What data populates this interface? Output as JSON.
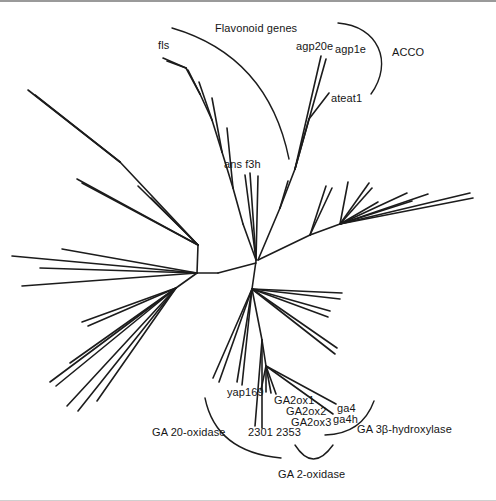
{
  "figure": {
    "width": 496,
    "height": 501,
    "background": "#ffffff",
    "branch_color": "#1c1c1c",
    "frame_top_color": "#9a9a9a",
    "frame_bottom_color": "#cfcfcf",
    "type": "unrooted-phylogenetic-tree"
  },
  "labels": [
    {
      "id": "flavonoid-genes",
      "text": "Flavonoid genes",
      "x": 215,
      "y": 20
    },
    {
      "id": "fls",
      "text": "fls",
      "x": 158,
      "y": 37
    },
    {
      "id": "agp20e",
      "text": "agp20e",
      "x": 296,
      "y": 38
    },
    {
      "id": "agp1e",
      "text": "agp1e",
      "x": 335,
      "y": 41
    },
    {
      "id": "acco",
      "text": "ACCO",
      "x": 392,
      "y": 44
    },
    {
      "id": "ateat1",
      "text": "ateat1",
      "x": 331,
      "y": 90
    },
    {
      "id": "ans-f3h",
      "text": "ans  f3h",
      "x": 224,
      "y": 156
    },
    {
      "id": "yap169",
      "text": "yap169",
      "x": 227,
      "y": 384
    },
    {
      "id": "ga2ox1",
      "text": "GA2ox1",
      "x": 274,
      "y": 392
    },
    {
      "id": "ga2ox2",
      "text": "GA2ox2",
      "x": 286,
      "y": 403
    },
    {
      "id": "ga2ox3",
      "text": "GA2ox3",
      "x": 291,
      "y": 414
    },
    {
      "id": "ga4",
      "text": "ga4",
      "x": 337,
      "y": 400
    },
    {
      "id": "ga4h",
      "text": "ga4h",
      "x": 333,
      "y": 411
    },
    {
      "id": "clones-2301-2353",
      "text": "2301 2353",
      "x": 248,
      "y": 424
    },
    {
      "id": "ga-20-oxidase",
      "text": "GA 20-oxidase",
      "x": 152,
      "y": 424
    },
    {
      "id": "ga-3b-hydroxylase",
      "text": "GA 3β-hydroxylase",
      "x": 357,
      "y": 421
    },
    {
      "id": "ga-2-oxidase",
      "text": "GA 2-oxidase",
      "x": 278,
      "y": 466
    }
  ],
  "arcs": [
    {
      "id": "flavonoid-genes-arc",
      "path": "M172,26 Q268,54 289,157"
    },
    {
      "id": "acco-arc",
      "path": "M338,21 C378,24 394,60 371,92"
    },
    {
      "id": "ga-20-oxidase-arc",
      "path": "M205,396 Q216,450 281,456"
    },
    {
      "id": "ga-3b-hydroxylase-arc",
      "path": "M325,433 Q362,432 374,399"
    },
    {
      "id": "ga-2-oxidase-arc",
      "path": "M295,443 Q313,471 333,443"
    }
  ],
  "tree": {
    "segments": [
      [
        256,
        259,
        252,
        287
      ],
      [
        256,
        261,
        218,
        271
      ],
      [
        218,
        271,
        197,
        271
      ],
      [
        256,
        258,
        243,
        222
      ],
      [
        243,
        222,
        233,
        186
      ],
      [
        233,
        186,
        222,
        150
      ],
      [
        222,
        150,
        212,
        118
      ],
      [
        212,
        118,
        200,
        92
      ],
      [
        200,
        92,
        186,
        66
      ],
      [
        186,
        66,
        163,
        56
      ],
      [
        186,
        66,
        167,
        59
      ],
      [
        200,
        92,
        188,
        68
      ],
      [
        212,
        118,
        199,
        80
      ],
      [
        222,
        150,
        212,
        96
      ],
      [
        233,
        186,
        227,
        126
      ],
      [
        256,
        258,
        245,
        173
      ],
      [
        256,
        258,
        250,
        171
      ],
      [
        256,
        258,
        258,
        174
      ],
      [
        258,
        258,
        280,
        206
      ],
      [
        280,
        206,
        295,
        167
      ],
      [
        295,
        167,
        321,
        54
      ],
      [
        295,
        167,
        326,
        57
      ],
      [
        295,
        167,
        309,
        117
      ],
      [
        309,
        117,
        329,
        91
      ],
      [
        280,
        206,
        288,
        179
      ],
      [
        258,
        258,
        310,
        233
      ],
      [
        310,
        233,
        326,
        184
      ],
      [
        310,
        233,
        332,
        186
      ],
      [
        310,
        233,
        340,
        222
      ],
      [
        340,
        222,
        348,
        180
      ],
      [
        340,
        222,
        369,
        181
      ],
      [
        340,
        222,
        372,
        186
      ],
      [
        340,
        222,
        378,
        200
      ],
      [
        340,
        222,
        407,
        191
      ],
      [
        340,
        222,
        412,
        199
      ],
      [
        340,
        222,
        428,
        192
      ],
      [
        340,
        222,
        470,
        191
      ],
      [
        340,
        222,
        473,
        196
      ],
      [
        197,
        271,
        198,
        243
      ],
      [
        198,
        243,
        77,
        177
      ],
      [
        198,
        243,
        82,
        181
      ],
      [
        198,
        243,
        138,
        184
      ],
      [
        198,
        243,
        151,
        196
      ],
      [
        198,
        243,
        120,
        160
      ],
      [
        120,
        160,
        28,
        88
      ],
      [
        120,
        160,
        35,
        93
      ],
      [
        197,
        271,
        62,
        247
      ],
      [
        197,
        271,
        40,
        266
      ],
      [
        197,
        271,
        22,
        284
      ],
      [
        197,
        271,
        12,
        254
      ],
      [
        197,
        271,
        176,
        286
      ],
      [
        176,
        286,
        82,
        320
      ],
      [
        176,
        286,
        88,
        324
      ],
      [
        176,
        286,
        70,
        361
      ],
      [
        176,
        286,
        50,
        380
      ],
      [
        176,
        286,
        56,
        384
      ],
      [
        176,
        286,
        67,
        404
      ],
      [
        176,
        286,
        78,
        409
      ],
      [
        176,
        286,
        97,
        399
      ],
      [
        252,
        287,
        342,
        291
      ],
      [
        252,
        287,
        340,
        297
      ],
      [
        252,
        287,
        330,
        309
      ],
      [
        252,
        287,
        328,
        315
      ],
      [
        252,
        287,
        337,
        346
      ],
      [
        252,
        287,
        335,
        352
      ],
      [
        252,
        287,
        262,
        338
      ],
      [
        262,
        338,
        266,
        364
      ],
      [
        266,
        364,
        261,
        388
      ],
      [
        266,
        364,
        266,
        390
      ],
      [
        266,
        364,
        271,
        391
      ],
      [
        266,
        364,
        276,
        392
      ],
      [
        266,
        364,
        336,
        402
      ],
      [
        266,
        364,
        333,
        412
      ],
      [
        262,
        338,
        255,
        424
      ],
      [
        262,
        338,
        262,
        426
      ],
      [
        252,
        287,
        237,
        380
      ],
      [
        252,
        287,
        242,
        383
      ],
      [
        252,
        287,
        213,
        376
      ],
      [
        252,
        287,
        219,
        380
      ]
    ]
  }
}
